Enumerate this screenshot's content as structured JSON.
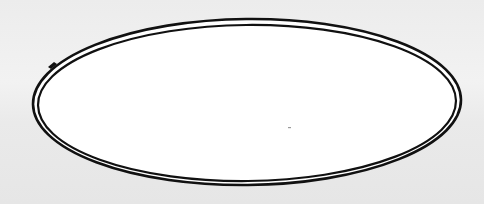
{
  "figure": {
    "description": "Hand-drawn double-outline ellipse",
    "shape": "ellipse",
    "outline": "double",
    "colors": {
      "background": "#eeeeee",
      "fill": "#ffffff",
      "stroke": "#111111"
    },
    "geometry": {
      "cx": 247,
      "cy": 102,
      "outer_rx": 214,
      "outer_ry": 83,
      "inner_rx": 209,
      "inner_ry": 78
    }
  }
}
